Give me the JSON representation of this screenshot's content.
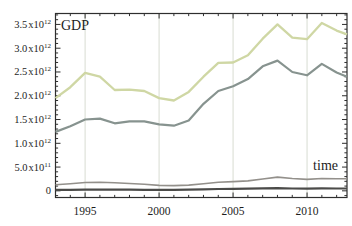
{
  "chart_data": {
    "type": "line",
    "title": "",
    "y_label_inplot": "GDP",
    "x_label_inplot": "time",
    "legend": "none",
    "grid": "vertical-major-only",
    "x": [
      1993,
      1994,
      1995,
      1996,
      1997,
      1998,
      1999,
      2000,
      2001,
      2002,
      2003,
      2004,
      2005,
      2006,
      2007,
      2008,
      2009,
      2010,
      2011,
      2012
    ],
    "x_axis": {
      "min": 1993,
      "max": 2012.7,
      "major_ticks": [
        1995,
        2000,
        2005,
        2010
      ],
      "major_tick_labels": [
        "1995",
        "2000",
        "2005",
        "2010"
      ],
      "minor_tick_step_years": 1
    },
    "y_axis": {
      "min_e12": -0.14,
      "max_e12": 3.73,
      "minor_tick_step_e12": 0.1,
      "tick_labels": [
        {
          "mantissa": "3.5",
          "base": "x10",
          "exponent": "12",
          "value_e12": 3.5
        },
        {
          "mantissa": "3.0",
          "base": "x10",
          "exponent": "12",
          "value_e12": 3.0
        },
        {
          "mantissa": "2.5",
          "base": "x10",
          "exponent": "12",
          "value_e12": 2.5
        },
        {
          "mantissa": "2.0",
          "base": "x10",
          "exponent": "12",
          "value_e12": 2.0
        },
        {
          "mantissa": "1.5",
          "base": "x10",
          "exponent": "12",
          "value_e12": 1.5
        },
        {
          "mantissa": "1.0",
          "base": "x10",
          "exponent": "12",
          "value_e12": 1.0
        },
        {
          "mantissa": "5.0",
          "base": "x10",
          "exponent": "11",
          "value_e12": 0.5
        },
        {
          "mantissa": "0",
          "base": "",
          "exponent": "",
          "value_e12": 0
        }
      ]
    },
    "series": [
      {
        "name": "series-1-light-green",
        "color": "#cfd7a4",
        "values_e12": [
          1.95,
          2.18,
          2.48,
          2.4,
          2.12,
          2.13,
          2.1,
          1.95,
          1.9,
          2.08,
          2.4,
          2.69,
          2.7,
          2.85,
          3.2,
          3.5,
          3.22,
          3.19,
          3.53,
          3.37
        ]
      },
      {
        "name": "series-2-gray-teal",
        "color": "#87938f",
        "values_e12": [
          1.24,
          1.36,
          1.5,
          1.52,
          1.42,
          1.46,
          1.46,
          1.4,
          1.37,
          1.48,
          1.83,
          2.1,
          2.2,
          2.35,
          2.62,
          2.74,
          2.5,
          2.43,
          2.67,
          2.49
        ]
      },
      {
        "name": "series-3-gray",
        "color": "#93908b",
        "values_e12": [
          0.13,
          0.15,
          0.175,
          0.18,
          0.17,
          0.155,
          0.14,
          0.115,
          0.11,
          0.12,
          0.15,
          0.18,
          0.195,
          0.21,
          0.25,
          0.29,
          0.26,
          0.24,
          0.26,
          0.255
        ]
      },
      {
        "name": "series-4-dark",
        "color": "#4b4b49",
        "values_e12": [
          0.02,
          0.022,
          0.025,
          0.025,
          0.024,
          0.024,
          0.023,
          0.022,
          0.023,
          0.026,
          0.032,
          0.038,
          0.042,
          0.046,
          0.052,
          0.058,
          0.05,
          0.048,
          0.052,
          0.05
        ]
      }
    ]
  },
  "colors": {
    "background": "#ffffff",
    "frame": "#2e2e2e",
    "gridline": "#d8dcd2",
    "text": "#1d1d1d"
  }
}
